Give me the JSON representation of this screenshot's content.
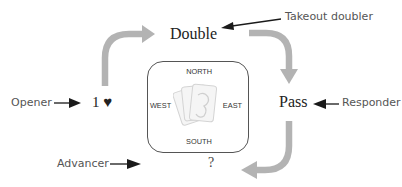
{
  "diagram": {
    "bids": {
      "opener": "1 ♥",
      "takeout": "Double",
      "responder": "Pass",
      "advancer": "?"
    },
    "roles": {
      "takeout": "Takeout doubler",
      "opener": "Opener",
      "responder": "Responder",
      "advancer": "Advancer"
    },
    "table": {
      "north": "NORTH",
      "south": "SOUTH",
      "west": "WEST",
      "east": "EAST",
      "center_icon": "playing-cards"
    },
    "colors": {
      "flow_arrow": "#b3b3b3",
      "pointer_arrow": "#1a1a1a",
      "label_text": "#555555",
      "bid_text": "#222222",
      "table_border": "#555555"
    }
  }
}
